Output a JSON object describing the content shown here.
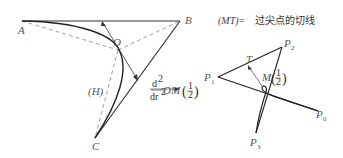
{
  "left_figure": {
    "points": {
      "A": "A",
      "B": "B",
      "C": "C",
      "O": "O"
    },
    "curve_label": "(H)",
    "vector_label": {
      "numerator": "d",
      "num_exp": "2",
      "denominator": "dr",
      "den_exp": "2",
      "vector": "OM",
      "arg_open": "(",
      "arg_num": "1",
      "arg_den": "2",
      "arg_close": ")"
    }
  },
  "right_figure": {
    "title_prefix": "(MT)=",
    "title_text": "过尖点的切线",
    "points": {
      "P0": "P",
      "P0_sub": "0",
      "P1": "P",
      "P1_sub": "1",
      "P2": "P",
      "P2_sub": "2",
      "P3": "P",
      "P3_sub": "3",
      "T": "T",
      "M": "M",
      "M_arg_num": "1",
      "M_arg_den": "2"
    }
  },
  "colors": {
    "line": "#222222",
    "dashed": "#777777",
    "text": "#555555"
  }
}
